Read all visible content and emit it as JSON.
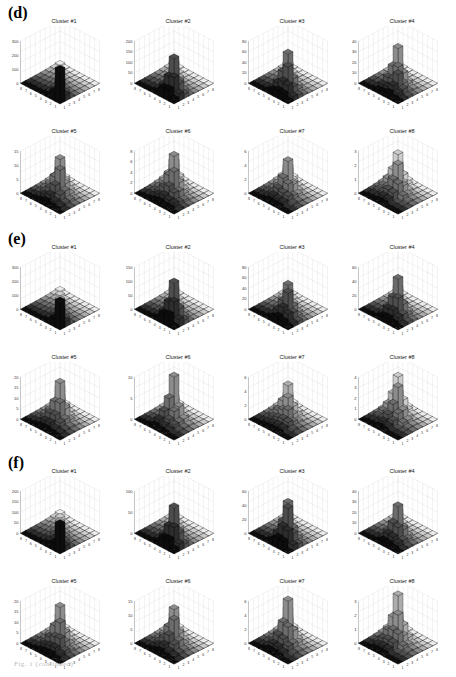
{
  "figure": {
    "caption": "Fig. 1  (continued)",
    "panels": [
      {
        "label": "(d)",
        "top": 0
      },
      {
        "label": "(e)",
        "top": 226
      },
      {
        "label": "(f)",
        "top": 450
      }
    ]
  },
  "chart_data": [
    {
      "panel": "d",
      "title": "Cluster #1",
      "type": "bar3d",
      "zlim": [
        0,
        300
      ],
      "zticks": [
        0,
        100,
        200,
        300
      ],
      "xticks": [
        1,
        2,
        3,
        4,
        5,
        6,
        7,
        8
      ],
      "yticks": [
        1,
        2,
        3,
        4,
        5,
        6,
        7,
        8
      ],
      "peak": 240,
      "profile": [
        240,
        120,
        70,
        40,
        30,
        25,
        20,
        15
      ]
    },
    {
      "panel": "d",
      "title": "Cluster #2",
      "type": "bar3d",
      "zlim": [
        0,
        200
      ],
      "zticks": [
        0,
        50,
        100,
        150,
        200
      ],
      "xticks": [
        1,
        2,
        3,
        4,
        5,
        6,
        7,
        8
      ],
      "yticks": [
        1,
        2,
        3,
        4,
        5,
        6,
        7,
        8
      ],
      "peak": 165,
      "profile": [
        20,
        100,
        165,
        120,
        60,
        30,
        20,
        15
      ]
    },
    {
      "panel": "d",
      "title": "Cluster #3",
      "type": "bar3d",
      "zlim": [
        0,
        80
      ],
      "zticks": [
        0,
        20,
        40,
        60,
        80
      ],
      "xticks": [
        1,
        2,
        3,
        4,
        5,
        6,
        7,
        8
      ],
      "yticks": [
        1,
        2,
        3,
        4,
        5,
        6,
        7,
        8
      ],
      "peak": 65,
      "profile": [
        5,
        25,
        50,
        65,
        35,
        15,
        10,
        5
      ]
    },
    {
      "panel": "d",
      "title": "Cluster #4",
      "type": "bar3d",
      "zlim": [
        0,
        40
      ],
      "zticks": [
        0,
        10,
        20,
        30,
        40
      ],
      "xticks": [
        1,
        2,
        3,
        4,
        5,
        6,
        7,
        8
      ],
      "yticks": [
        1,
        2,
        3,
        4,
        5,
        6,
        7,
        8
      ],
      "peak": 33,
      "profile": [
        2,
        5,
        18,
        20,
        33,
        10,
        5,
        3
      ]
    },
    {
      "panel": "d",
      "title": "Cluster #5",
      "type": "bar3d",
      "zlim": [
        0,
        15
      ],
      "zticks": [
        0,
        5,
        10,
        15
      ],
      "xticks": [
        1,
        2,
        3,
        4,
        5,
        6,
        7,
        8
      ],
      "yticks": [
        1,
        2,
        3,
        4,
        5,
        6,
        7,
        8
      ],
      "peak": 12,
      "profile": [
        0,
        1,
        3,
        10,
        12,
        9,
        5,
        2
      ]
    },
    {
      "panel": "d",
      "title": "Cluster #6",
      "type": "bar3d",
      "zlim": [
        0,
        8
      ],
      "zticks": [
        0,
        2,
        4,
        6,
        8
      ],
      "xticks": [
        1,
        2,
        3,
        4,
        5,
        6,
        7,
        8
      ],
      "yticks": [
        1,
        2,
        3,
        4,
        5,
        6,
        7,
        8
      ],
      "peak": 7,
      "profile": [
        0,
        1,
        2,
        5,
        7,
        5,
        4,
        2
      ]
    },
    {
      "panel": "d",
      "title": "Cluster #7",
      "type": "bar3d",
      "zlim": [
        0,
        6
      ],
      "zticks": [
        0,
        2,
        4,
        6
      ],
      "xticks": [
        1,
        2,
        3,
        4,
        5,
        6,
        7,
        8
      ],
      "yticks": [
        1,
        2,
        3,
        4,
        5,
        6,
        7,
        8
      ],
      "peak": 4.5,
      "profile": [
        0,
        0,
        1,
        2,
        4.5,
        3,
        2,
        1
      ]
    },
    {
      "panel": "d",
      "title": "Cluster #8",
      "type": "bar3d",
      "zlim": [
        0,
        3
      ],
      "zticks": [
        0,
        1,
        2,
        3
      ],
      "xticks": [
        1,
        2,
        3,
        4,
        5,
        6,
        7,
        8
      ],
      "yticks": [
        1,
        2,
        3,
        4,
        5,
        6,
        7,
        8
      ],
      "peak": 2,
      "profile": [
        0,
        0,
        0,
        1,
        2,
        1.5,
        2,
        1
      ]
    },
    {
      "panel": "e",
      "title": "Cluster #1",
      "type": "bar3d",
      "zlim": [
        0,
        300
      ],
      "zticks": [
        0,
        100,
        200,
        300
      ],
      "xticks": [
        1,
        2,
        3,
        4,
        5,
        6,
        7,
        8
      ],
      "yticks": [
        1,
        2,
        3,
        4,
        5,
        6,
        7,
        8
      ],
      "peak": 200,
      "profile": [
        200,
        110,
        70,
        45,
        35,
        25,
        20,
        15
      ]
    },
    {
      "panel": "e",
      "title": "Cluster #2",
      "type": "bar3d",
      "zlim": [
        0,
        150
      ],
      "zticks": [
        0,
        50,
        100,
        150
      ],
      "xticks": [
        1,
        2,
        3,
        4,
        5,
        6,
        7,
        8
      ],
      "yticks": [
        1,
        2,
        3,
        4,
        5,
        6,
        7,
        8
      ],
      "peak": 130,
      "profile": [
        10,
        80,
        130,
        90,
        40,
        20,
        15,
        10
      ]
    },
    {
      "panel": "e",
      "title": "Cluster #3",
      "type": "bar3d",
      "zlim": [
        0,
        80
      ],
      "zticks": [
        0,
        20,
        40,
        60,
        80
      ],
      "xticks": [
        1,
        2,
        3,
        4,
        5,
        6,
        7,
        8
      ],
      "yticks": [
        1,
        2,
        3,
        4,
        5,
        6,
        7,
        8
      ],
      "peak": 55,
      "profile": [
        5,
        20,
        50,
        55,
        30,
        15,
        10,
        5
      ]
    },
    {
      "panel": "e",
      "title": "Cluster #4",
      "type": "bar3d",
      "zlim": [
        0,
        60
      ],
      "zticks": [
        0,
        20,
        40,
        60
      ],
      "xticks": [
        1,
        2,
        3,
        4,
        5,
        6,
        7,
        8
      ],
      "yticks": [
        1,
        2,
        3,
        4,
        5,
        6,
        7,
        8
      ],
      "peak": 50,
      "profile": [
        2,
        10,
        30,
        50,
        30,
        10,
        5,
        3
      ]
    },
    {
      "panel": "e",
      "title": "Cluster #5",
      "type": "bar3d",
      "zlim": [
        0,
        20
      ],
      "zticks": [
        0,
        5,
        10,
        15,
        20
      ],
      "xticks": [
        1,
        2,
        3,
        4,
        5,
        6,
        7,
        8
      ],
      "yticks": [
        1,
        2,
        3,
        4,
        5,
        6,
        7,
        8
      ],
      "peak": 17,
      "profile": [
        0,
        1,
        3,
        10,
        17,
        12,
        6,
        2
      ]
    },
    {
      "panel": "e",
      "title": "Cluster #6",
      "type": "bar3d",
      "zlim": [
        0,
        10
      ],
      "zticks": [
        0,
        5,
        10
      ],
      "xticks": [
        1,
        2,
        3,
        4,
        5,
        6,
        7,
        8
      ],
      "yticks": [
        1,
        2,
        3,
        4,
        5,
        6,
        7,
        8
      ],
      "peak": 10,
      "profile": [
        0,
        0,
        1,
        3,
        10,
        4,
        2,
        1
      ]
    },
    {
      "panel": "e",
      "title": "Cluster #7",
      "type": "bar3d",
      "zlim": [
        0,
        6
      ],
      "zticks": [
        0,
        2,
        4,
        6
      ],
      "xticks": [
        1,
        2,
        3,
        4,
        5,
        6,
        7,
        8
      ],
      "yticks": [
        1,
        2,
        3,
        4,
        5,
        6,
        7,
        8
      ],
      "peak": 4,
      "profile": [
        0,
        0,
        1,
        2,
        3,
        4,
        2,
        1
      ]
    },
    {
      "panel": "e",
      "title": "Cluster #8",
      "type": "bar3d",
      "zlim": [
        0,
        4
      ],
      "zticks": [
        0,
        1,
        2,
        3,
        4
      ],
      "xticks": [
        1,
        2,
        3,
        4,
        5,
        6,
        7,
        8
      ],
      "yticks": [
        1,
        2,
        3,
        4,
        5,
        6,
        7,
        8
      ],
      "peak": 3,
      "profile": [
        0,
        0,
        0,
        1,
        3,
        2,
        3,
        1
      ]
    },
    {
      "panel": "f",
      "title": "Cluster #1",
      "type": "bar3d",
      "zlim": [
        0,
        200
      ],
      "zticks": [
        0,
        50,
        100,
        150,
        200
      ],
      "xticks": [
        1,
        2,
        3,
        4,
        5,
        6,
        7,
        8
      ],
      "yticks": [
        1,
        2,
        3,
        4,
        5,
        6,
        7,
        8
      ],
      "peak": 140,
      "profile": [
        140,
        70,
        60,
        50,
        35,
        25,
        20,
        15
      ]
    },
    {
      "panel": "f",
      "title": "Cluster #2",
      "type": "bar3d",
      "zlim": [
        0,
        100
      ],
      "zticks": [
        0,
        50,
        100
      ],
      "xticks": [
        1,
        2,
        3,
        4,
        5,
        6,
        7,
        8
      ],
      "yticks": [
        1,
        2,
        3,
        4,
        5,
        6,
        7,
        8
      ],
      "peak": 85,
      "profile": [
        10,
        50,
        85,
        60,
        30,
        15,
        10,
        5
      ]
    },
    {
      "panel": "f",
      "title": "Cluster #3",
      "type": "bar3d",
      "zlim": [
        0,
        60
      ],
      "zticks": [
        0,
        20,
        40,
        60
      ],
      "xticks": [
        1,
        2,
        3,
        4,
        5,
        6,
        7,
        8
      ],
      "yticks": [
        1,
        2,
        3,
        4,
        5,
        6,
        7,
        8
      ],
      "peak": 50,
      "profile": [
        2,
        25,
        50,
        50,
        25,
        10,
        5,
        3
      ]
    },
    {
      "panel": "f",
      "title": "Cluster #4",
      "type": "bar3d",
      "zlim": [
        0,
        40
      ],
      "zticks": [
        0,
        10,
        20,
        30,
        40
      ],
      "xticks": [
        1,
        2,
        3,
        4,
        5,
        6,
        7,
        8
      ],
      "yticks": [
        1,
        2,
        3,
        4,
        5,
        6,
        7,
        8
      ],
      "peak": 30,
      "profile": [
        1,
        5,
        15,
        30,
        20,
        8,
        4,
        2
      ]
    },
    {
      "panel": "f",
      "title": "Cluster #5",
      "type": "bar3d",
      "zlim": [
        0,
        20
      ],
      "zticks": [
        0,
        5,
        10,
        15,
        20
      ],
      "xticks": [
        1,
        2,
        3,
        4,
        5,
        6,
        7,
        8
      ],
      "yticks": [
        1,
        2,
        3,
        4,
        5,
        6,
        7,
        8
      ],
      "peak": 17,
      "profile": [
        0,
        2,
        7,
        12,
        17,
        10,
        5,
        2
      ]
    },
    {
      "panel": "f",
      "title": "Cluster #6",
      "type": "bar3d",
      "zlim": [
        0,
        15
      ],
      "zticks": [
        0,
        5,
        10,
        15
      ],
      "xticks": [
        1,
        2,
        3,
        4,
        5,
        6,
        7,
        8
      ],
      "yticks": [
        1,
        2,
        3,
        4,
        5,
        6,
        7,
        8
      ],
      "peak": 12,
      "profile": [
        0,
        1,
        3,
        10,
        12,
        8,
        4,
        2
      ]
    },
    {
      "panel": "f",
      "title": "Cluster #7",
      "type": "bar3d",
      "zlim": [
        0,
        6
      ],
      "zticks": [
        0,
        2,
        4,
        6
      ],
      "xticks": [
        1,
        2,
        3,
        4,
        5,
        6,
        7,
        8
      ],
      "yticks": [
        1,
        2,
        3,
        4,
        5,
        6,
        7,
        8
      ],
      "peak": 6,
      "profile": [
        0,
        0,
        1,
        3,
        6,
        4,
        2,
        1
      ]
    },
    {
      "panel": "f",
      "title": "Cluster #8",
      "type": "bar3d",
      "zlim": [
        0,
        3
      ],
      "zticks": [
        0,
        1,
        2,
        3
      ],
      "xticks": [
        1,
        2,
        3,
        4,
        5,
        6,
        7,
        8
      ],
      "yticks": [
        1,
        2,
        3,
        4,
        5,
        6,
        7,
        8
      ],
      "peak": 3,
      "profile": [
        0,
        0,
        0,
        1,
        2,
        3,
        1,
        1
      ]
    }
  ]
}
